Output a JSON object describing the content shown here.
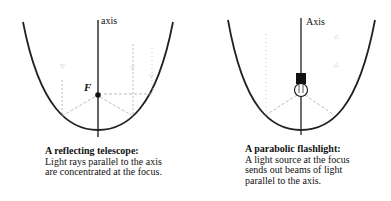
{
  "figures": [
    {
      "id": "telescope",
      "axis_label": "axis",
      "focus_label": "F",
      "caption_title": "A reflecting telescope:",
      "caption_body": "Light rays parallel to the axis are concentrated at the focus."
    },
    {
      "id": "flashlight",
      "axis_label": "Axis",
      "caption_title": "A parabolic flashlight:",
      "caption_body": "A light source at the focus sends out beams of light parallel to the axis."
    }
  ],
  "colors": {
    "curve": "#222222",
    "rays": "#9a9a9a",
    "background": "#ffffff"
  }
}
